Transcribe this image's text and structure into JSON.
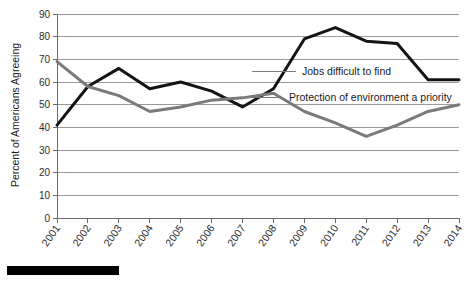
{
  "chart_data": {
    "type": "line",
    "title": "",
    "xlabel": "",
    "ylabel": "Percent of Americans Agreeing",
    "categories": [
      "2001",
      "2002",
      "2003",
      "2004",
      "2005",
      "2006",
      "2007",
      "2008",
      "2009",
      "2010",
      "2011",
      "2012",
      "2013",
      "2014"
    ],
    "ylim": [
      0,
      90
    ],
    "ytick_step": 10,
    "yticks": [
      "90",
      "80",
      "70",
      "60",
      "50",
      "40",
      "30",
      "20",
      "10",
      "0"
    ],
    "grid": "horizontal",
    "legend_position": "inline-annotations",
    "series": [
      {
        "name": "Jobs difficult to find",
        "color": "#141414",
        "width": 3,
        "values": [
          41,
          58,
          66,
          57,
          60,
          56,
          49,
          57,
          79,
          84,
          78,
          77,
          61,
          61
        ]
      },
      {
        "name": "Protection of environment a priority",
        "color": "#7a7a7a",
        "width": 3,
        "values": [
          69,
          58,
          54,
          47,
          49,
          52,
          53,
          55,
          47,
          42,
          36,
          41,
          47,
          50
        ]
      }
    ],
    "annotations": [
      {
        "text": "Jobs difficult to find",
        "series": "Jobs difficult to find"
      },
      {
        "text": "Protection of environment a priority",
        "series": "Protection of environment a priority"
      }
    ]
  }
}
